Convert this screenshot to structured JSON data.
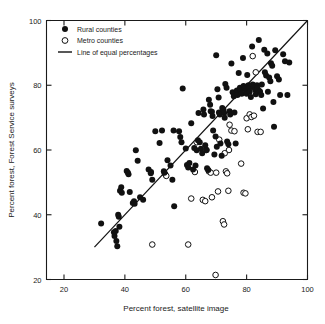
{
  "chart_data": {
    "type": "scatter",
    "title": "",
    "xlabel": "Percent forest, satellite image",
    "ylabel": "Percent forest, Forest Service surveys",
    "xlim": [
      14,
      100
    ],
    "ylim": [
      17,
      100
    ],
    "xticks": [
      20,
      40,
      60,
      80,
      100
    ],
    "yticks": [
      20,
      40,
      60,
      80,
      100
    ],
    "xtick_labels": [
      "20",
      "40",
      "60",
      "80",
      "100"
    ],
    "ytick_labels": [
      "20",
      "40",
      "60",
      "80",
      "100"
    ],
    "grid": false,
    "legend_position": "top-left",
    "legend": [
      {
        "label": "Rural counties",
        "marker": "filled-circle",
        "color": "#111111"
      },
      {
        "label": "Metro counties",
        "marker": "open-circle",
        "color": "#111111"
      },
      {
        "label": "Line of equal percentages",
        "marker": "line",
        "color": "#111111"
      }
    ],
    "reference_line": {
      "name": "Line of equal percentages",
      "x": [
        30,
        100
      ],
      "y": [
        30,
        100
      ],
      "color": "#111111"
    },
    "series": [
      {
        "name": "Rural counties",
        "marker": "filled-circle",
        "color": "#111111",
        "points": [
          [
            32.2,
            37.3
          ],
          [
            36.4,
            34.6
          ],
          [
            36.6,
            33.4
          ],
          [
            37.0,
            35.0
          ],
          [
            37.2,
            31.9
          ],
          [
            37.5,
            30.3
          ],
          [
            37.8,
            40.0
          ],
          [
            38.0,
            39.4
          ],
          [
            38.2,
            36.3
          ],
          [
            38.4,
            47.4
          ],
          [
            38.8,
            48.5
          ],
          [
            39.0,
            46.8
          ],
          [
            40.6,
            53.5
          ],
          [
            41.0,
            53.0
          ],
          [
            41.2,
            52.5
          ],
          [
            41.6,
            47.0
          ],
          [
            42.6,
            43.6
          ],
          [
            43.0,
            44.2
          ],
          [
            43.2,
            43.4
          ],
          [
            43.6,
            59.9
          ],
          [
            44.2,
            56.7
          ],
          [
            45.0,
            45.4
          ],
          [
            46.0,
            44.6
          ],
          [
            47.8,
            54.0
          ],
          [
            48.6,
            53.2
          ],
          [
            49.0,
            50.8
          ],
          [
            50.0,
            65.8
          ],
          [
            51.4,
            62.2
          ],
          [
            52.2,
            66.0
          ],
          [
            52.8,
            53.4
          ],
          [
            53.0,
            53.0
          ],
          [
            54.0,
            56.8
          ],
          [
            55.0,
            55.2
          ],
          [
            55.6,
            50.8
          ],
          [
            56.2,
            42.6
          ],
          [
            57.8,
            65.8
          ],
          [
            58.2,
            64.0
          ],
          [
            59.0,
            79.0
          ],
          [
            60.0,
            60.5
          ],
          [
            60.4,
            55.4
          ],
          [
            60.8,
            54.6
          ],
          [
            61.2,
            56.0
          ],
          [
            61.8,
            68.3
          ],
          [
            62.4,
            54.0
          ],
          [
            62.8,
            60.6
          ],
          [
            63.2,
            55.2
          ],
          [
            63.6,
            59.9
          ],
          [
            64.0,
            63.0
          ],
          [
            64.6,
            62.4
          ],
          [
            65.0,
            60.4
          ],
          [
            65.4,
            59.0
          ],
          [
            65.8,
            72.5
          ],
          [
            66.0,
            71.0
          ],
          [
            66.4,
            61.5
          ],
          [
            66.8,
            60.0
          ],
          [
            67.0,
            54.4
          ],
          [
            67.4,
            53.8
          ],
          [
            67.6,
            75.5
          ],
          [
            68.0,
            74.0
          ],
          [
            68.2,
            72.0
          ],
          [
            68.6,
            71.8
          ],
          [
            68.8,
            70.5
          ],
          [
            69.0,
            66.0
          ],
          [
            69.4,
            58.6
          ],
          [
            69.8,
            64.2
          ],
          [
            70.0,
            89.3
          ],
          [
            70.4,
            78.8
          ],
          [
            70.8,
            76.2
          ],
          [
            70.9,
            71.6
          ],
          [
            71.2,
            71.0
          ],
          [
            71.4,
            62.0
          ],
          [
            71.8,
            58.2
          ],
          [
            72.0,
            73.0
          ],
          [
            72.4,
            72.4
          ],
          [
            72.6,
            71.4
          ],
          [
            72.8,
            70.0
          ],
          [
            73.0,
            80.4
          ],
          [
            73.4,
            79.2
          ],
          [
            73.6,
            62.6
          ],
          [
            74.0,
            61.8
          ],
          [
            74.4,
            72.0
          ],
          [
            74.6,
            71.0
          ],
          [
            75.0,
            86.7
          ],
          [
            75.4,
            77.8
          ],
          [
            75.8,
            76.6
          ],
          [
            76.0,
            71.6
          ],
          [
            76.4,
            62.0
          ],
          [
            76.8,
            78.4
          ],
          [
            77.0,
            77.0
          ],
          [
            77.4,
            83.8
          ],
          [
            77.8,
            79.2
          ],
          [
            78.0,
            78.6
          ],
          [
            78.4,
            77.4
          ],
          [
            78.8,
            88.4
          ],
          [
            79.0,
            79.8
          ],
          [
            79.4,
            79.0
          ],
          [
            79.8,
            78.2
          ],
          [
            80.0,
            77.4
          ],
          [
            80.2,
            83.2
          ],
          [
            80.6,
            80.0
          ],
          [
            80.8,
            79.0
          ],
          [
            81.0,
            78.0
          ],
          [
            81.4,
            76.4
          ],
          [
            81.8,
            92.0
          ],
          [
            82.0,
            80.2
          ],
          [
            82.4,
            79.4
          ],
          [
            82.8,
            78.6
          ],
          [
            83.0,
            77.2
          ],
          [
            83.4,
            80.0
          ],
          [
            83.6,
            79.0
          ],
          [
            84.0,
            94.0
          ],
          [
            84.4,
            78.0
          ],
          [
            84.8,
            77.0
          ],
          [
            85.0,
            80.2
          ],
          [
            85.4,
            72.8
          ],
          [
            85.8,
            91.0
          ],
          [
            86.0,
            84.0
          ],
          [
            86.4,
            83.0
          ],
          [
            86.8,
            89.8
          ],
          [
            87.0,
            78.0
          ],
          [
            87.4,
            82.4
          ],
          [
            87.8,
            81.2
          ],
          [
            88.0,
            86.8
          ],
          [
            88.4,
            86.0
          ],
          [
            88.8,
            74.8
          ],
          [
            89.0,
            67.2
          ],
          [
            89.4,
            90.8
          ],
          [
            90.0,
            82.8
          ],
          [
            90.6,
            81.8
          ],
          [
            91.0,
            77.0
          ],
          [
            92.0,
            89.6
          ],
          [
            92.6,
            87.4
          ],
          [
            93.4,
            77.0
          ],
          [
            94.0,
            87.0
          ],
          [
            56.0,
            66.0
          ],
          [
            48.5,
            52.8
          ],
          [
            64.2,
            71.4
          ],
          [
            70.2,
            61.0
          ],
          [
            58.6,
            62.4
          ]
        ]
      },
      {
        "name": "Metro counties",
        "marker": "open-circle",
        "color": "#111111",
        "points": [
          [
            49.0,
            30.8
          ],
          [
            53.2,
            52.6
          ],
          [
            53.6,
            52.0
          ],
          [
            60.8,
            30.8
          ],
          [
            61.8,
            45.0
          ],
          [
            63.0,
            53.2
          ],
          [
            63.6,
            62.4
          ],
          [
            65.6,
            44.6
          ],
          [
            66.4,
            44.2
          ],
          [
            67.6,
            53.4
          ],
          [
            68.2,
            53.0
          ],
          [
            68.6,
            45.4
          ],
          [
            69.8,
            21.4
          ],
          [
            70.0,
            53.0
          ],
          [
            70.6,
            47.2
          ],
          [
            72.2,
            38.0
          ],
          [
            72.6,
            37.0
          ],
          [
            73.2,
            53.4
          ],
          [
            73.6,
            52.8
          ],
          [
            74.0,
            47.4
          ],
          [
            74.2,
            60.0
          ],
          [
            74.4,
            67.8
          ],
          [
            75.0,
            66.0
          ],
          [
            76.0,
            65.8
          ],
          [
            78.2,
            55.8
          ],
          [
            79.0,
            46.8
          ],
          [
            79.6,
            46.6
          ],
          [
            80.0,
            69.8
          ],
          [
            80.4,
            66.4
          ],
          [
            81.0,
            71.0
          ],
          [
            81.6,
            70.2
          ],
          [
            82.0,
            89.0
          ],
          [
            82.4,
            70.6
          ],
          [
            83.0,
            84.0
          ],
          [
            83.6,
            65.6
          ],
          [
            84.2,
            78.2
          ],
          [
            84.6,
            65.6
          ],
          [
            71.0,
            63.2
          ],
          [
            66.8,
            60.0
          ],
          [
            72.8,
            59.0
          ]
        ]
      }
    ]
  }
}
